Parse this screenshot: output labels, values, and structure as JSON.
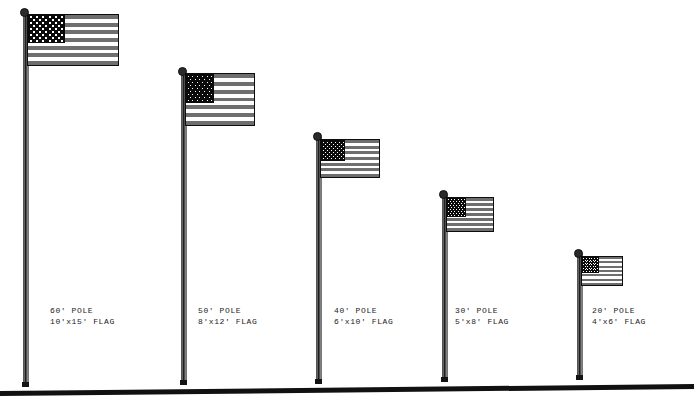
{
  "diagram": {
    "background_color": "#ffffff",
    "ground": {
      "name": "ground-line",
      "color": "#111111",
      "left_y": 391,
      "right_y": 384,
      "thickness": 5
    },
    "flag_colors": {
      "stripe_dark": "#6e6e6e",
      "stripe_light": "#fdfdfd",
      "canton": "#0b0b0b",
      "star": "#ffffff",
      "outline": "#0d0d0d",
      "pole_dark": "#1a1a1a",
      "pole_light": "#9a9a9a"
    },
    "flag_spec": {
      "stripe_count": 13,
      "star_rows": 9,
      "star_cols": 11
    },
    "installations": [
      {
        "id": "pole-60",
        "pole_label": "60' POLE",
        "flag_label": "10'x15' FLAG",
        "pole_height_ft": 60,
        "flag_width_ft": 15,
        "flag_height_ft": 10,
        "pole_x": 23,
        "pole_top_y": 14,
        "pole_bottom_y": 386,
        "finial_x": 20,
        "finial_y": 8,
        "flag_x": 27,
        "flag_y": 14,
        "flag_w": 92,
        "flag_h": 52,
        "label_x": 50,
        "label_y": 305
      },
      {
        "id": "pole-50",
        "pole_label": "50' POLE",
        "flag_label": "8'x12' FLAG",
        "pole_height_ft": 50,
        "flag_width_ft": 12,
        "flag_height_ft": 8,
        "pole_x": 181,
        "pole_top_y": 73,
        "pole_bottom_y": 384,
        "finial_x": 178,
        "finial_y": 67,
        "flag_x": 185,
        "flag_y": 73,
        "flag_w": 70,
        "flag_h": 53,
        "label_x": 198,
        "label_y": 305
      },
      {
        "id": "pole-40",
        "pole_label": "40' POLE",
        "flag_label": "6'x10' FLAG",
        "pole_height_ft": 40,
        "flag_width_ft": 10,
        "flag_height_ft": 6,
        "pole_x": 316,
        "pole_top_y": 137,
        "pole_bottom_y": 383,
        "finial_x": 313,
        "finial_y": 132,
        "flag_x": 320,
        "flag_y": 139,
        "flag_w": 60,
        "flag_h": 39,
        "label_x": 334,
        "label_y": 305
      },
      {
        "id": "pole-30",
        "pole_label": "30' POLE",
        "flag_label": "5'x8' FLAG",
        "pole_height_ft": 30,
        "flag_width_ft": 8,
        "flag_height_ft": 5,
        "pole_x": 442,
        "pole_top_y": 195,
        "pole_bottom_y": 381,
        "finial_x": 439,
        "finial_y": 190,
        "flag_x": 446,
        "flag_y": 197,
        "flag_w": 48,
        "flag_h": 35,
        "label_x": 455,
        "label_y": 305
      },
      {
        "id": "pole-20",
        "pole_label": "20' POLE",
        "flag_label": "4'x6' FLAG",
        "pole_height_ft": 20,
        "flag_width_ft": 6,
        "flag_height_ft": 4,
        "pole_x": 577,
        "pole_top_y": 254,
        "pole_bottom_y": 379,
        "finial_x": 574,
        "finial_y": 249,
        "flag_x": 581,
        "flag_y": 256,
        "flag_w": 42,
        "flag_h": 30,
        "label_x": 592,
        "label_y": 305
      }
    ]
  }
}
